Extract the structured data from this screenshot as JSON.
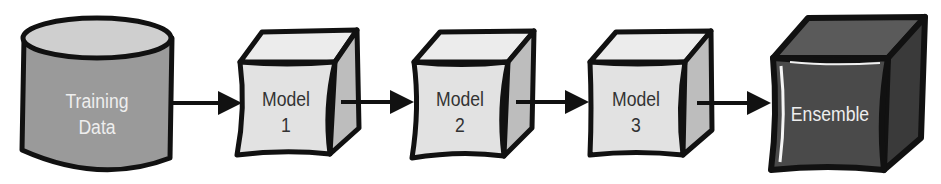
{
  "diagram": {
    "type": "flow",
    "nodes": [
      {
        "id": "training-data",
        "shape": "cylinder",
        "label_line1": "Training",
        "label_line2": "Data",
        "fill": "#9a9a9a"
      },
      {
        "id": "model-1",
        "shape": "cube",
        "label_line1": "Model",
        "label_line2": "1",
        "fill": "#e2e2e2"
      },
      {
        "id": "model-2",
        "shape": "cube",
        "label_line1": "Model",
        "label_line2": "2",
        "fill": "#e2e2e2"
      },
      {
        "id": "model-3",
        "shape": "cube",
        "label_line1": "Model",
        "label_line2": "3",
        "fill": "#e2e2e2"
      },
      {
        "id": "ensemble",
        "shape": "cube",
        "label_line1": "Ensemble",
        "label_line2": "",
        "fill": "#4a4a4a"
      }
    ],
    "edges": [
      {
        "from": "training-data",
        "to": "model-1"
      },
      {
        "from": "model-1",
        "to": "model-2"
      },
      {
        "from": "model-2",
        "to": "model-3"
      },
      {
        "from": "model-3",
        "to": "ensemble"
      }
    ],
    "colors": {
      "outline": "#111111",
      "light_face": "#e2e2e2",
      "light_top": "#ececec",
      "light_side": "#bdbdbd",
      "dark_face": "#4a4a4a",
      "dark_top": "#5a5a5a",
      "dark_side": "#3a3a3a",
      "cylinder_body": "#9a9a9a",
      "cylinder_top": "#cfcfcf"
    }
  }
}
